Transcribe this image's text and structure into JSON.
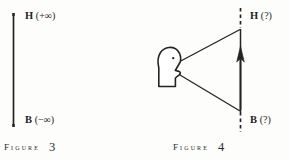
{
  "page": {
    "background_color": "#fdfdfc",
    "ink_color": "#232323"
  },
  "figures": [
    {
      "id": "figure-3",
      "caption_word": "Figure",
      "caption_number": "3",
      "description": "vertical solid line with labelled endpoints",
      "labels": {
        "top": {
          "point": "H",
          "value": "(+∞)",
          "full": "H (+∞)"
        },
        "bottom": {
          "point": "B",
          "value": "(−∞)",
          "full": "B (−∞)"
        }
      },
      "line": {
        "style": "solid",
        "arrowheads": "none"
      }
    },
    {
      "id": "figure-4",
      "caption_word": "Figure",
      "caption_number": "4",
      "description": "observer head in profile viewing a vertical line with upward arrow; line ends dashed and labelled with unknown values",
      "labels": {
        "top": {
          "point": "H",
          "value": "(?)",
          "full": "H (?)"
        },
        "bottom": {
          "point": "B",
          "value": "(?)",
          "full": "B (?)"
        }
      },
      "line": {
        "style": "solid-with-dashed-extensions",
        "arrowheads": "up"
      },
      "observer": {
        "facing": "right",
        "sight_lines": 2
      }
    }
  ]
}
